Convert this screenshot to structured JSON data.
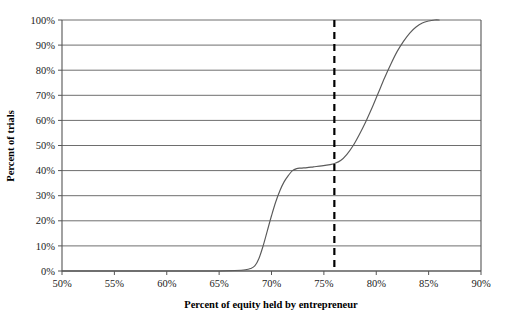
{
  "chart_data": {
    "type": "line",
    "title": "",
    "subtitle": "",
    "xlabel": "Percent of equity held by entrepreneur",
    "ylabel": "Percent of trials",
    "xlim": [
      50,
      90
    ],
    "ylim": [
      0,
      100
    ],
    "grid": "horizontal",
    "legend": "none",
    "x_tick_labels": [
      "50%",
      "55%",
      "60%",
      "65%",
      "70%",
      "75%",
      "80%",
      "85%",
      "90%"
    ],
    "x_tick_values": [
      50,
      55,
      60,
      65,
      70,
      75,
      80,
      85,
      90
    ],
    "y_tick_labels": [
      "0%",
      "10%",
      "20%",
      "30%",
      "40%",
      "50%",
      "60%",
      "70%",
      "80%",
      "90%",
      "100%"
    ],
    "y_tick_values": [
      0,
      10,
      20,
      30,
      40,
      50,
      60,
      70,
      80,
      90,
      100
    ],
    "series": [
      {
        "name": "Cumulative distribution of trials",
        "type": "line",
        "color": "#5a5a5a",
        "x": [
          50.0,
          55.0,
          60.0,
          63.0,
          65.0,
          66.5,
          67.5,
          68.0,
          68.4,
          68.8,
          69.2,
          69.6,
          70.0,
          70.4,
          70.8,
          71.2,
          71.6,
          72.0,
          72.4,
          72.8,
          73.4,
          74.0,
          74.8,
          75.6,
          76.0,
          76.6,
          77.2,
          77.8,
          78.4,
          79.0,
          79.6,
          80.2,
          80.8,
          81.4,
          82.0,
          82.6,
          83.2,
          83.8,
          84.4,
          85.0,
          85.6,
          86.0
        ],
        "y": [
          0.0,
          0.0,
          0.0,
          0.0,
          0.0,
          0.2,
          0.5,
          1.0,
          2.0,
          5.0,
          10.0,
          16.0,
          22.0,
          27.5,
          32.0,
          35.5,
          38.0,
          40.0,
          40.8,
          41.0,
          41.2,
          41.5,
          41.9,
          42.4,
          42.8,
          44.0,
          46.5,
          50.0,
          54.5,
          59.5,
          65.0,
          71.0,
          77.0,
          82.5,
          87.5,
          91.5,
          94.8,
          97.2,
          98.8,
          99.6,
          100.0,
          100.0
        ]
      }
    ],
    "annotations": [
      {
        "name": "threshold-line",
        "type": "vertical-dashed-line",
        "x": 76,
        "color": "#000000",
        "label": ""
      }
    ]
  }
}
